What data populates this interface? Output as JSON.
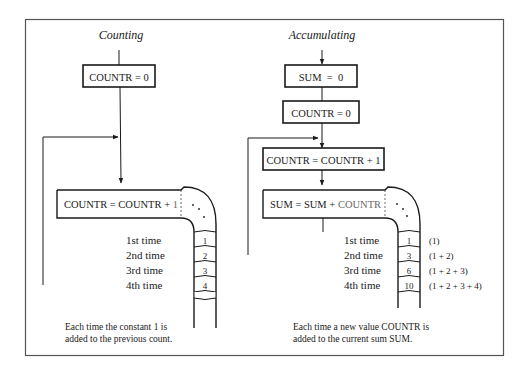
{
  "diagram": {
    "colors": {
      "ink": "#1a1a1a",
      "frame": "#555555",
      "highlight": "#6a6a6a",
      "background": "#ffffff"
    },
    "counting": {
      "title": "Counting",
      "init_box": "COUNTR = 0",
      "pipe_box_prefix": "COUNTR = COUNTR + ",
      "pipe_box_highlight": "1",
      "iterations": [
        {
          "label": "1st time",
          "value": "1"
        },
        {
          "label": "2nd time",
          "value": "2"
        },
        {
          "label": "3rd time",
          "value": "3"
        },
        {
          "label": "4th time",
          "value": "4"
        }
      ],
      "caption_line1": "Each time the constant 1 is",
      "caption_line2": "added to the previous count."
    },
    "accumulating": {
      "title": "Accumulating",
      "init_box_1": "SUM  =  0",
      "init_box_2": "COUNTR = 0",
      "increment_box": "COUNTR = COUNTR + 1",
      "pipe_box_prefix": "SUM = SUM + ",
      "pipe_box_highlight": "COUNTR",
      "iterations": [
        {
          "label": "1st time",
          "value": "1",
          "expansion": "(1)"
        },
        {
          "label": "2nd time",
          "value": "3",
          "expansion": "(1 + 2)"
        },
        {
          "label": "3rd time",
          "value": "6",
          "expansion": "(1 + 2 + 3)"
        },
        {
          "label": "4th time",
          "value": "10",
          "expansion": "(1 + 2 + 3 + 4)"
        }
      ],
      "caption_line1": "Each time a new value COUNTR is",
      "caption_line2": "added to the current sum SUM."
    }
  }
}
